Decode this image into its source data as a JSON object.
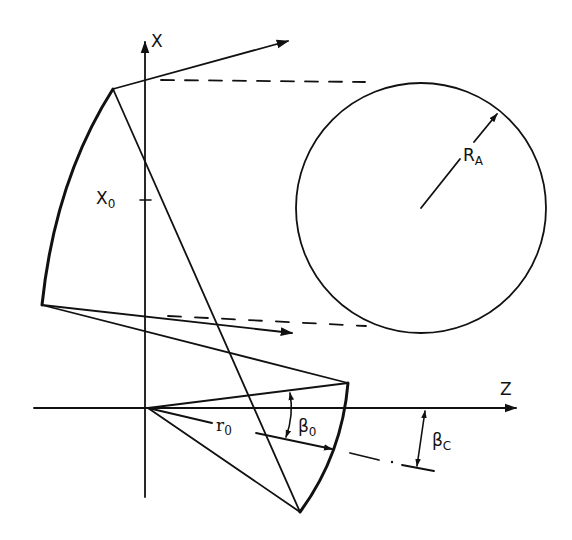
{
  "figure": {
    "type": "geometric optics / projection diagram",
    "stroke_color": "#111111",
    "background": "#ffffff"
  },
  "axes": {
    "x_axis_label": "X",
    "z_axis_label": "Z",
    "x0_label": {
      "main": "X",
      "sub": "0"
    }
  },
  "labels": {
    "r0": {
      "main": "r",
      "sub": "0"
    },
    "beta0": {
      "main": "β",
      "sub": "0"
    },
    "betaC": {
      "main": "β",
      "sub": "C"
    },
    "RA": {
      "main": "R",
      "sub": "A"
    }
  },
  "elements": {
    "circle": {
      "label": "R_A",
      "center": [
        420,
        208
      ],
      "radius": 125
    },
    "upper_vertex": [
      113,
      89
    ],
    "lower_vertex": [
      42,
      305
    ],
    "right_arc_top": [
      348,
      383
    ],
    "right_arc_bottom": [
      300,
      512
    ],
    "origin": [
      148,
      408
    ]
  }
}
